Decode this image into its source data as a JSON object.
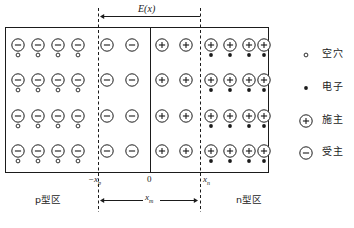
{
  "figure": {
    "title_field": "E(x)",
    "field_arrow_direction": "left",
    "box": {
      "x": 5,
      "y": 27,
      "w": 263,
      "h": 145
    },
    "junction_line_x": 150,
    "boundaries": [
      {
        "name": "-x_p",
        "x": 98,
        "label_main": "−x",
        "label_sub": "p"
      },
      {
        "name": "0",
        "x": 150,
        "label_main": "0",
        "label_sub": ""
      },
      {
        "name": "x_n",
        "x": 200,
        "label_main": "x",
        "label_sub": "n"
      }
    ],
    "depletion_width_label_main": "x",
    "depletion_width_label_sub": "m",
    "region_left_label": "p型区",
    "region_right_label": "n型区",
    "rows_y": [
      45,
      80,
      116,
      151
    ],
    "columns": [
      {
        "x": 18,
        "charge": "minus",
        "carrier": "hole"
      },
      {
        "x": 38,
        "charge": "minus",
        "carrier": "hole"
      },
      {
        "x": 58,
        "charge": "minus",
        "carrier": "hole"
      },
      {
        "x": 78,
        "charge": "minus",
        "carrier": "hole"
      },
      {
        "x": 107,
        "charge": "minus",
        "carrier": "none"
      },
      {
        "x": 132,
        "charge": "minus",
        "carrier": "none"
      },
      {
        "x": 162,
        "charge": "plus",
        "carrier": "none"
      },
      {
        "x": 186,
        "charge": "plus",
        "carrier": "none"
      },
      {
        "x": 211,
        "charge": "plus",
        "carrier": "electron"
      },
      {
        "x": 230,
        "charge": "plus",
        "carrier": "electron"
      },
      {
        "x": 249,
        "charge": "plus",
        "carrier": "electron"
      },
      {
        "x": 264,
        "charge": "plus",
        "carrier": "electron"
      }
    ],
    "colors": {
      "stroke": "#1b1b1b",
      "box_fill": "#ffffff",
      "dash": "#1b1b1b",
      "carrier_fill": "#1b1b1b"
    }
  },
  "legend": {
    "items": [
      {
        "symbol": "hole",
        "label": "空穴",
        "y": 55
      },
      {
        "symbol": "electron",
        "label": "电子",
        "y": 88
      },
      {
        "symbol": "donor",
        "label": "施主",
        "y": 121
      },
      {
        "symbol": "acceptor",
        "label": "受主",
        "y": 153
      }
    ],
    "symbol_x": 306,
    "text_x": 322
  }
}
